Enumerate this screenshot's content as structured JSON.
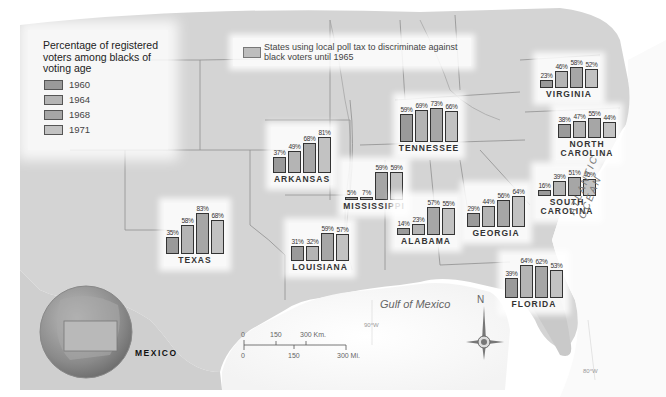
{
  "legend": {
    "title": "Percentage of registered voters among blacks of voting age",
    "years": [
      {
        "label": "1960",
        "color": "#9a9a9a"
      },
      {
        "label": "1964",
        "color": "#b4b4b4"
      },
      {
        "label": "1968",
        "color": "#a6a6a6"
      },
      {
        "label": "1971",
        "color": "#c2c2c2"
      }
    ]
  },
  "poll_tax_legend": {
    "text": "States using local poll tax to discriminate against black voters until 1965",
    "color": "#bdbdbd"
  },
  "labels": {
    "ocean": "ATLANTIC OCEAN",
    "gulf": "Gulf of Mexico",
    "country": "MEXICO",
    "north": "N",
    "lon_1": "90°W",
    "lon_2": "80°W",
    "lon_3": "80°W"
  },
  "scale_bar": {
    "km_labels": [
      "0",
      "150",
      "300 Km."
    ],
    "mi_labels": [
      "0",
      "150",
      "300 Mi."
    ]
  },
  "chart_data": {
    "type": "bar",
    "title": "Percentage of registered voters among blacks of voting age",
    "categories": [
      "1960",
      "1964",
      "1968",
      "1971"
    ],
    "ylabel": "Percent registered",
    "ylim": [
      0,
      100
    ],
    "grid": false,
    "legend_position": "top-left",
    "series": [
      {
        "name": "Virginia",
        "values": [
          23,
          46,
          58,
          52
        ]
      },
      {
        "name": "North Carolina",
        "values": [
          38,
          47,
          55,
          44
        ]
      },
      {
        "name": "Tennessee",
        "values": [
          59,
          69,
          73,
          66
        ]
      },
      {
        "name": "Arkansas",
        "values": [
          37,
          49,
          68,
          81
        ]
      },
      {
        "name": "Mississippi",
        "values": [
          5,
          7,
          59,
          59
        ]
      },
      {
        "name": "South Carolina",
        "values": [
          16,
          39,
          51,
          46
        ]
      },
      {
        "name": "Texas",
        "values": [
          35,
          58,
          83,
          68
        ]
      },
      {
        "name": "Louisiana",
        "values": [
          31,
          32,
          59,
          57
        ]
      },
      {
        "name": "Alabama",
        "values": [
          14,
          23,
          57,
          55
        ]
      },
      {
        "name": "Georgia",
        "values": [
          29,
          44,
          56,
          64
        ]
      },
      {
        "name": "Florida",
        "values": [
          39,
          64,
          62,
          53
        ]
      }
    ]
  },
  "states": [
    {
      "id": "virginia",
      "name": "VIRGINIA",
      "x": 540,
      "base": 88,
      "scale": 0.36,
      "values": [
        23,
        46,
        58,
        52
      ],
      "pct": [
        "23%",
        "46%",
        "58%",
        "52%"
      ]
    },
    {
      "id": "north-carolina",
      "name": "NORTH CAROLINA",
      "x": 558,
      "base": 138,
      "scale": 0.36,
      "values": [
        38,
        47,
        55,
        44
      ],
      "pct": [
        "38%",
        "47%",
        "55%",
        "44%"
      ]
    },
    {
      "id": "tennessee",
      "name": "TENNESSEE",
      "x": 400,
      "base": 142,
      "scale": 0.47,
      "values": [
        59,
        69,
        73,
        66
      ],
      "pct": [
        "59%",
        "69%",
        "73%",
        "66%"
      ]
    },
    {
      "id": "arkansas",
      "name": "ARKANSAS",
      "x": 273,
      "base": 173,
      "scale": 0.44,
      "values": [
        37,
        49,
        68,
        81
      ],
      "pct": [
        "37%",
        "49%",
        "68%",
        "81%"
      ]
    },
    {
      "id": "mississippi",
      "name": "MISSISSIPPI",
      "x": 345,
      "base": 200,
      "scale": 0.48,
      "values": [
        5,
        7,
        59,
        59
      ],
      "pct": [
        "5%",
        "7%",
        "59%",
        "59%"
      ]
    },
    {
      "id": "south-carolina",
      "name": "SOUTH CAROLINA",
      "x": 538,
      "base": 196,
      "scale": 0.38,
      "values": [
        16,
        39,
        51,
        46
      ],
      "pct": [
        "16%",
        "39%",
        "51%",
        "46%"
      ]
    },
    {
      "id": "texas",
      "name": "TEXAS",
      "x": 166,
      "base": 254,
      "scale": 0.5,
      "values": [
        35,
        58,
        83,
        68
      ],
      "pct": [
        "35%",
        "58%",
        "83%",
        "68%"
      ]
    },
    {
      "id": "louisiana",
      "name": "LOUISIANA",
      "x": 291,
      "base": 261,
      "scale": 0.48,
      "values": [
        31,
        32,
        59,
        57
      ],
      "pct": [
        "31%",
        "32%",
        "59%",
        "57%"
      ]
    },
    {
      "id": "alabama",
      "name": "ALABAMA",
      "x": 397,
      "base": 235,
      "scale": 0.5,
      "values": [
        14,
        23,
        57,
        55
      ],
      "pct": [
        "14%",
        "23%",
        "57%",
        "55%"
      ]
    },
    {
      "id": "georgia",
      "name": "GEORGIA",
      "x": 467,
      "base": 227,
      "scale": 0.48,
      "values": [
        29,
        44,
        56,
        64
      ],
      "pct": [
        "29%",
        "44%",
        "56%",
        "64%"
      ]
    },
    {
      "id": "florida",
      "name": "FLORIDA",
      "x": 505,
      "base": 298,
      "scale": 0.52,
      "values": [
        39,
        64,
        62,
        53
      ],
      "pct": [
        "39%",
        "64%",
        "62%",
        "53%"
      ]
    }
  ]
}
